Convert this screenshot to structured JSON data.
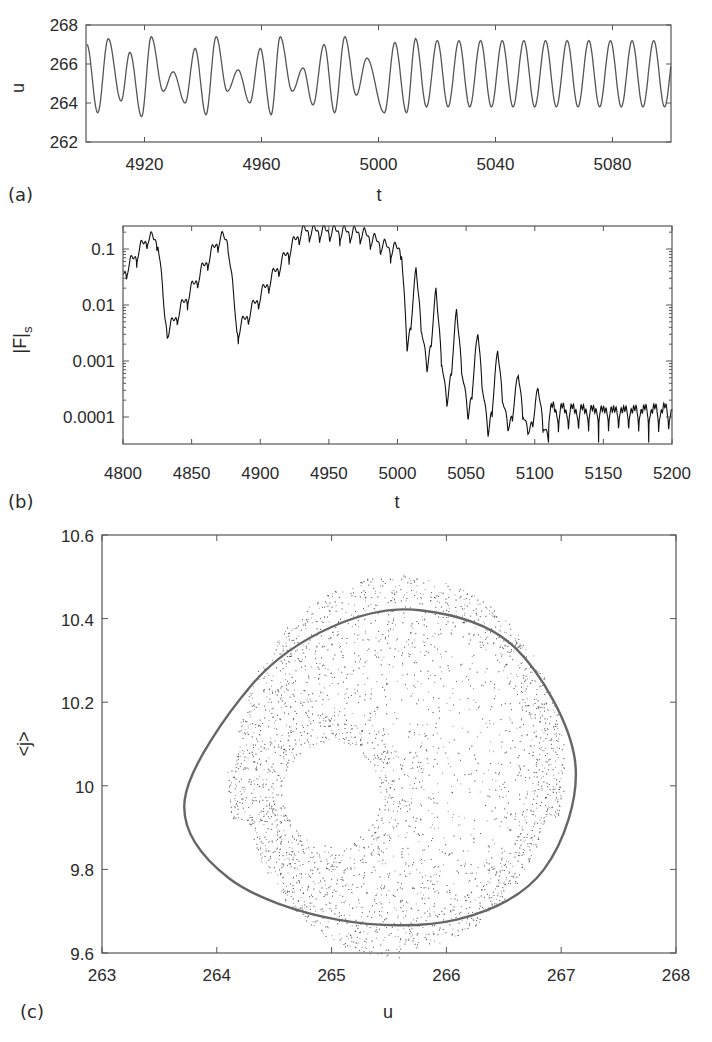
{
  "figure": {
    "panels": [
      {
        "id": "a",
        "label": "(a)"
      },
      {
        "id": "b",
        "label": "(b)"
      },
      {
        "id": "c",
        "label": "(c)"
      }
    ]
  },
  "chart_data": [
    {
      "panel": "(a)",
      "type": "line",
      "title": "",
      "xlabel": "t",
      "ylabel": "u",
      "xlim": [
        4900,
        5100
      ],
      "ylim": [
        262,
        268
      ],
      "xticks": [
        4920,
        4960,
        5000,
        5040,
        5080
      ],
      "yticks": [
        262,
        264,
        266,
        268
      ],
      "grid": false,
      "extrema": {
        "x": [
          4900.3,
          4904,
          4907.6,
          4912,
          4915,
          4919,
          4922.3,
          4926.4,
          4929.8,
          4933.9,
          4937.3,
          4941,
          4944.5,
          4948.3,
          4952,
          4956,
          4959.6,
          4963.3,
          4966.4,
          4970.5,
          4974.2,
          4977.6,
          4981.4,
          4985,
          4988.5,
          4992.4,
          4996,
          5002,
          5005.6,
          5009.6,
          5012.7
        ],
        "y": [
          267.0,
          263.5,
          267.3,
          264.1,
          266.6,
          263.3,
          267.4,
          264.6,
          265.6,
          264.0,
          266.8,
          263.4,
          267.4,
          264.6,
          265.7,
          264.0,
          266.8,
          263.4,
          267.4,
          264.6,
          265.8,
          263.9,
          267.0,
          263.5,
          267.4,
          264.4,
          266.3,
          263.5,
          267.1,
          263.5,
          267.3
        ]
      },
      "periodic_regime": {
        "t_start": 5012.7,
        "period": 7.4,
        "max": 267.2,
        "min": 263.8
      }
    },
    {
      "panel": "(b)",
      "type": "line",
      "title": "",
      "xlabel": "t",
      "ylabel": "|F|_s",
      "yscale": "log",
      "xlim": [
        4800,
        5200
      ],
      "ylim": [
        3e-05,
        0.25
      ],
      "xticks": [
        4800,
        4850,
        4900,
        4950,
        5000,
        5050,
        5100,
        5150,
        5200
      ],
      "yticks": [
        0.1,
        0.01,
        0.001,
        0.0001
      ],
      "ytick_labels": [
        "0.1",
        "0.01",
        "0.001",
        "0.0001"
      ],
      "grid": false,
      "envelope": {
        "x": [
          4800,
          4818,
          4825.5,
          4830.6,
          4833,
          4870.7,
          4876.5,
          4883,
          4930,
          4951,
          4974,
          4994.5,
          5003,
          5007,
          5013.5,
          5021.5,
          5028,
          5036,
          5043,
          5051.4,
          5058.6,
          5066,
          5073,
          5080.5,
          5088,
          5095,
          5102.4,
          5109.7,
          5200
        ],
        "y": [
          0.042,
          0.19,
          0.17,
          0.0066,
          0.0041,
          0.19,
          0.17,
          0.0039,
          0.25,
          0.25,
          0.23,
          0.12,
          0.12,
          0.0017,
          0.046,
          0.0007,
          0.019,
          0.00016,
          0.0082,
          0.0001,
          0.0035,
          5e-05,
          0.0016,
          6e-05,
          0.0006,
          5e-05,
          0.00033,
          4e-05,
          0.00018
        ]
      },
      "plateau": {
        "t_start": 5110,
        "period": 7.3,
        "peak": 0.00018,
        "trough": 3.5e-05
      }
    },
    {
      "panel": "(c)",
      "type": "scatter",
      "title": "",
      "xlabel": "u",
      "ylabel": "<j>",
      "xlim": [
        263,
        268
      ],
      "ylim": [
        9.6,
        10.6
      ],
      "xticks": [
        263,
        264,
        265,
        266,
        267,
        268
      ],
      "yticks": [
        9.6,
        9.8,
        10,
        10.2,
        10.4,
        10.6
      ],
      "ytick_labels": [
        "9.6",
        "9.8",
        "10",
        "10.2",
        "10.4",
        "10.6"
      ],
      "grid": false,
      "series": [
        {
          "name": "chaotic attractor (dots)",
          "outer_extent": {
            "u": [
              263.3,
              267.4
            ],
            "j": [
              9.63,
              10.51
            ]
          },
          "hole_center": {
            "u": 265.0,
            "j": 9.98
          }
        },
        {
          "name": "limit cycle (solid line)",
          "u": [
            265.77,
            266.6,
            267.12,
            266.85,
            266.09,
            265.05,
            264.1,
            263.72,
            264.3,
            265.0,
            265.77
          ],
          "j": [
            10.42,
            10.33,
            10.06,
            9.8,
            9.68,
            9.68,
            9.78,
            9.966,
            10.24,
            10.38,
            10.42
          ]
        }
      ]
    }
  ]
}
